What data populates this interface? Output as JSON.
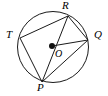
{
  "figure": {
    "kind": "circle-geometry-diagram",
    "width": 108,
    "height": 96,
    "background_color": "#ffffff",
    "stroke_color": "#1a1a1a",
    "label_color": "#000000"
  },
  "circle": {
    "name": "circle-O",
    "center_x": 53,
    "center_y": 47,
    "radius": 35.5
  },
  "center_point": {
    "label": "O",
    "x": 52,
    "y": 46,
    "dot_radius": 3,
    "label_x": 55,
    "label_y": 49
  },
  "points": [
    {
      "label": "T",
      "x": 20,
      "y": 38,
      "label_x": 6,
      "label_y": 29
    },
    {
      "label": "R",
      "x": 68,
      "y": 16,
      "label_x": 62,
      "label_y": 0
    },
    {
      "label": "Q",
      "x": 88,
      "y": 40,
      "label_x": 94,
      "label_y": 29
    },
    {
      "label": "P",
      "x": 42,
      "y": 82,
      "label_x": 37,
      "label_y": 82
    }
  ],
  "segments": [
    {
      "name": "chord-T-R",
      "from": "T",
      "to": "R",
      "x1": 20,
      "y1": 38,
      "x2": 68,
      "y2": 16
    },
    {
      "name": "chord-R-Q",
      "from": "R",
      "to": "Q",
      "x1": 68,
      "y1": 16,
      "x2": 88,
      "y2": 40
    },
    {
      "name": "chord-Q-P",
      "from": "Q",
      "to": "P",
      "x1": 88,
      "y1": 40,
      "x2": 42,
      "y2": 82
    },
    {
      "name": "chord-P-T",
      "from": "P",
      "to": "T",
      "x1": 42,
      "y1": 82,
      "x2": 20,
      "y2": 38
    },
    {
      "name": "diameter-R-P",
      "from": "R",
      "to": "P",
      "x1": 68,
      "y1": 16,
      "x2": 42,
      "y2": 82
    },
    {
      "name": "radius-O-Q",
      "from": "O",
      "to": "Q",
      "x1": 52,
      "y1": 46,
      "x2": 88,
      "y2": 40
    }
  ]
}
